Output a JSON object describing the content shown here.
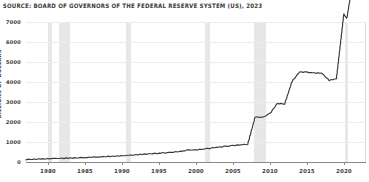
{
  "source_note": "SOURCE: BOARD OF GOVERNORS OF THE FEDERAL RESERVE SYSTEM (US), 2023",
  "colors": {
    "line": "#3a3a3a",
    "recession_band": "#d9d9d9",
    "gridline": "#ececec",
    "axis": "#8a8a8a",
    "background": "#ffffff"
  },
  "chart_data": {
    "type": "line",
    "title": "",
    "subtitle": "",
    "xlabel": "",
    "ylabel": "BILLIONS OF DOLLARS",
    "xlim": [
      1977,
      2023
    ],
    "ylim": [
      0,
      7000
    ],
    "grid": true,
    "legend": "none",
    "xticks": [
      "1980",
      "1985",
      "1990",
      "1995",
      "2000",
      "2005",
      "2010",
      "2015",
      "2020"
    ],
    "xtick_values": [
      1980,
      1985,
      1990,
      1995,
      2000,
      2005,
      2010,
      2015,
      2020
    ],
    "yticks": [
      "0",
      "1000",
      "2000",
      "3000",
      "4000",
      "5000",
      "6000",
      "7000"
    ],
    "ytick_values": [
      0,
      1000,
      2000,
      3000,
      4000,
      5000,
      6000,
      7000
    ],
    "series": [
      {
        "name": "Total Assets of the Federal Reserve",
        "x": [
          1977,
          1979,
          1981,
          1983,
          1985,
          1987,
          1989,
          1991,
          1993,
          1995,
          1996,
          1997,
          1998,
          1999,
          2000,
          2001,
          2002,
          2003,
          2004,
          2005,
          2006,
          2007,
          2008,
          2009,
          2010,
          2011,
          2012,
          2013,
          2014,
          2015,
          2016,
          2017,
          2018,
          2019,
          2020,
          2020.4,
          2021,
          2022,
          2022.3,
          2023
        ],
        "values": [
          125,
          150,
          175,
          195,
          225,
          260,
          290,
          330,
          390,
          440,
          470,
          500,
          530,
          600,
          600,
          650,
          700,
          740,
          780,
          820,
          860,
          890,
          2250,
          2230,
          2420,
          2920,
          2910,
          4030,
          4500,
          4490,
          4450,
          4450,
          4080,
          4170,
          7400,
          7170,
          8500,
          8950,
          8900,
          8400
        ]
      }
    ],
    "annotations": {
      "recession_bands": [
        {
          "label": "1980 recession",
          "start": 1980.0,
          "end": 1980.55
        },
        {
          "label": "1981-82 recession",
          "start": 1981.5,
          "end": 1982.9
        },
        {
          "label": "1990-91 recession",
          "start": 1990.5,
          "end": 1991.2
        },
        {
          "label": "2001 recession",
          "start": 2001.2,
          "end": 2001.9
        },
        {
          "label": "2007-09 recession",
          "start": 2007.9,
          "end": 2009.5
        },
        {
          "label": "2020 recession",
          "start": 2020.1,
          "end": 2020.6
        }
      ]
    }
  }
}
